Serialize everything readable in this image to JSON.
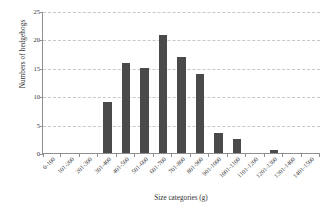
{
  "chart_data": {
    "type": "bar",
    "title": "",
    "xlabel": "Size categories (g)",
    "ylabel": "Numbers of hedgehogs",
    "categories": [
      "0-100",
      "101-200",
      "201-300",
      "301-400",
      "401-500",
      "501-600",
      "601-700",
      "701-800",
      "801-900",
      "901-1000",
      "1001-1100",
      "1101-1200",
      "1201-1300",
      "1301-1400",
      "1401-1500"
    ],
    "values": [
      0,
      0,
      0,
      9,
      16,
      15,
      21,
      17,
      14,
      3.5,
      2.5,
      0,
      0.5,
      0,
      0
    ],
    "ylim": [
      0,
      25
    ],
    "yticks": [
      0,
      5,
      10,
      15,
      20,
      25
    ],
    "ytick_labels": [
      "0",
      "5",
      "10",
      "15",
      "20",
      "25"
    ],
    "grid": "horizontal-dashed",
    "legend": "none",
    "bar_color": "#4a4a4a",
    "grid_color": "#c8c8c8",
    "axis_color": "#8f8f8f"
  }
}
